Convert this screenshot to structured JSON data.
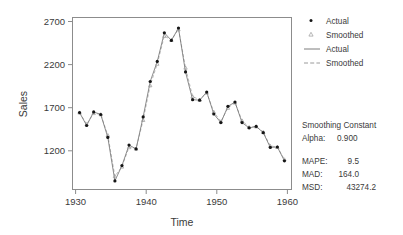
{
  "chart_data": {
    "type": "line",
    "title": "",
    "xlabel": "Time",
    "ylabel": "Sales",
    "xlim": [
      1930,
      1961
    ],
    "ylim": [
      1000,
      2800
    ],
    "grid": false,
    "legend_position": "right",
    "x": [
      1931,
      1932,
      1933,
      1934,
      1935,
      1936,
      1937,
      1938,
      1939,
      1940,
      1941,
      1942,
      1943,
      1944,
      1945,
      1946,
      1947,
      1948,
      1949,
      1950,
      1951,
      1952,
      1953,
      1954,
      1955,
      1956,
      1957,
      1958,
      1959,
      1960
    ],
    "xticks": [
      1930,
      1940,
      1950,
      1960
    ],
    "yticks": [
      1200,
      1700,
      2200,
      2700
    ],
    "series": [
      {
        "name": "Actual",
        "marker": "dot",
        "linestyle": "solid",
        "values": [
          1805,
          1670,
          1812,
          1785,
          1545,
          1090,
          1250,
          1465,
          1425,
          1760,
          2130,
          2340,
          2640,
          2560,
          2690,
          2230,
          1940,
          1935,
          2020,
          1790,
          1700,
          1870,
          1915,
          1700,
          1645,
          1660,
          1595,
          1440,
          1445,
          1300
        ]
      },
      {
        "name": "Smoothed",
        "marker": "triangle",
        "linestyle": "dashed",
        "values": [
          1805,
          1683,
          1799,
          1786,
          1569,
          1138,
          1239,
          1442,
          1427,
          1727,
          2090,
          2315,
          2607,
          2565,
          2677,
          2275,
          1973,
          1939,
          2012,
          1812,
          1711,
          1854,
          1909,
          1721,
          1652,
          1659,
          1601,
          1456,
          1444,
          1314
        ]
      }
    ]
  },
  "axis": {
    "y_title": "Sales",
    "x_title": "Time",
    "y_tick_labels": [
      "2700",
      "2200",
      "1700",
      "1200"
    ],
    "x_tick_labels": [
      "1930",
      "1940",
      "1950",
      "1960"
    ]
  },
  "legend": {
    "entries": [
      {
        "label": "Actual",
        "glyph": "dot-marker"
      },
      {
        "label": "Smoothed",
        "glyph": "triangle-marker"
      },
      {
        "label": "Actual",
        "glyph": "solid-line"
      },
      {
        "label": "Smoothed",
        "glyph": "dashed-line"
      }
    ]
  },
  "stats": {
    "smoothing_heading": "Smoothing Constant",
    "alpha_label": "Alpha:",
    "alpha_value": "0.900",
    "accuracy": [
      {
        "label": "MAPE:",
        "value": "9.5"
      },
      {
        "label": "MAD:",
        "value": "164.0"
      },
      {
        "label": "MSD:",
        "value": "43274.2"
      }
    ]
  },
  "colors": {
    "background": "#ffffff",
    "frame": "#8c8c8c",
    "actual_line": "#6e6e6e",
    "actual_marker": "#151515",
    "smoothed_line": "#a8a8a8",
    "text": "#3a3a3a"
  }
}
